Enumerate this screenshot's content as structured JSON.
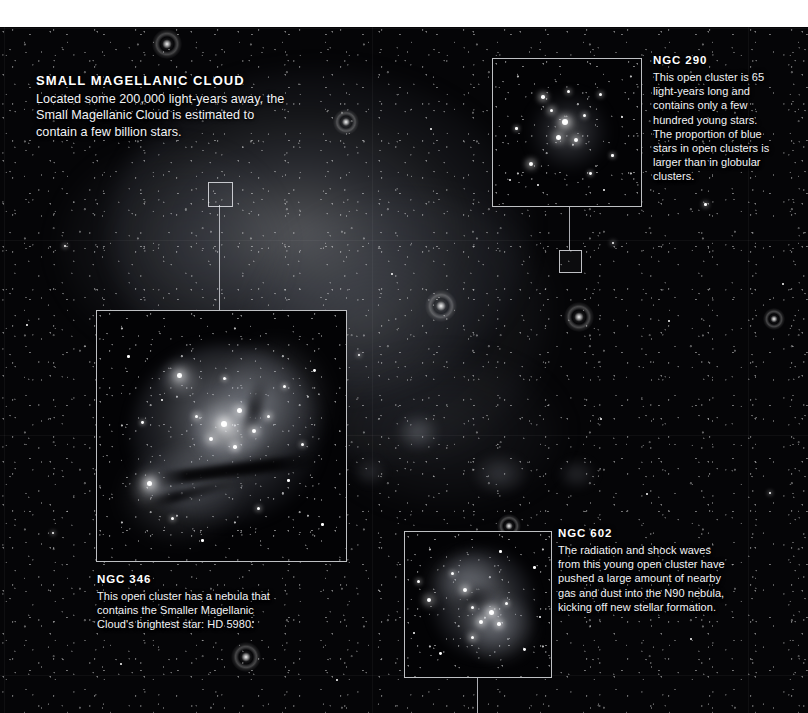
{
  "figure": {
    "subject": "Small Magellanic Cloud",
    "top_margin_color": "#ffffff",
    "plate_color": "#050507",
    "frame_color": "#e8eaee",
    "text_color": "#f2f3f6"
  },
  "callouts": [
    {
      "id": "smc",
      "title": "SMALL MAGELLANIC CLOUD",
      "body": "Located some 200,000 light-years away, the Small Magellanic Cloud is estimated to contain a few billion stars."
    },
    {
      "id": "ngc290",
      "title": "NGC 290",
      "body": "This open cluster is 65 light-years long and contains only a few hundred young stars. The proportion of blue stars in open clusters is larger than in globular clusters."
    },
    {
      "id": "ngc346",
      "title": "NGC 346",
      "body": "This open cluster has a nebula that contains the Smaller Magellanic Cloud's brightest star: HD 5980."
    },
    {
      "id": "ngc602",
      "title": "NGC 602",
      "body": "The radiation and shock waves from this young open cluster have pushed a large amount of nearby gas and dust into the N90 nebula, kicking off new stellar formation."
    }
  ],
  "insets": [
    {
      "id": "ngc290",
      "label": "NGC 290 open cluster detail"
    },
    {
      "id": "ngc346",
      "label": "NGC 346 nebula and cluster detail"
    },
    {
      "id": "ngc602",
      "label": "NGC 602 and N90 nebula detail"
    }
  ]
}
